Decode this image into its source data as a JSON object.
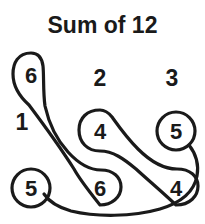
{
  "figure": {
    "title": "Sum of 12",
    "width": 205,
    "height": 224,
    "background_color": "#ffffff",
    "ink_color": "#1a1a1a"
  },
  "group_labels": [
    {
      "text": "1",
      "x": 22,
      "y": 130
    },
    {
      "text": "2",
      "x": 100,
      "y": 86
    },
    {
      "text": "3",
      "x": 172,
      "y": 86
    }
  ],
  "nodes": [
    {
      "id": "n1",
      "value": "6",
      "x": 31,
      "y": 75,
      "shape": "teardrop"
    },
    {
      "id": "n2",
      "value": "4",
      "x": 100,
      "y": 131,
      "shape": "teardrop"
    },
    {
      "id": "n3",
      "value": "5",
      "x": 176,
      "y": 131,
      "shape": "circle"
    },
    {
      "id": "n4",
      "value": "5",
      "x": 31,
      "y": 188,
      "shape": "circle"
    },
    {
      "id": "n5",
      "value": "6",
      "x": 100,
      "y": 188,
      "shape": "teardrop"
    },
    {
      "id": "n6",
      "value": "4",
      "x": 176,
      "y": 188,
      "shape": "teardrop"
    }
  ],
  "pairings": [
    {
      "group": "1",
      "from": "n1",
      "to": "n5"
    },
    {
      "group": "2",
      "from": "n2",
      "to": "n6"
    },
    {
      "group": "3",
      "from": "n3",
      "to": "n4"
    }
  ]
}
